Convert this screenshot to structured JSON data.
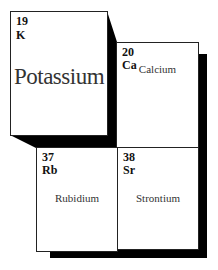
{
  "elements": [
    {
      "number": "19",
      "symbol": "K",
      "name": "Potassium",
      "highlighted": true
    },
    {
      "number": "20",
      "symbol": "Ca",
      "name": "Calcium",
      "highlighted": false
    },
    {
      "number": "37",
      "symbol": "Rb",
      "name": "Rubidium",
      "highlighted": false
    },
    {
      "number": "38",
      "symbol": "Sr",
      "name": "Strontium",
      "highlighted": false
    }
  ],
  "colors": {
    "shadow": "#000000",
    "cell_background": "#ffffff",
    "border": "#222222"
  }
}
